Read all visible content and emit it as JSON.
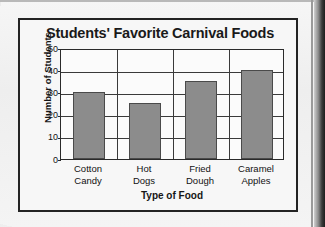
{
  "chart_data": {
    "type": "bar",
    "title": "Students' Favorite Carnival Foods",
    "xlabel": "Type of Food",
    "ylabel": "Number of Students",
    "categories": [
      "Cotton Candy",
      "Hot Dogs",
      "Fried Dough",
      "Caramel Apples"
    ],
    "category_lines": [
      [
        "Cotton",
        "Candy"
      ],
      [
        "Hot",
        "Dogs"
      ],
      [
        "Fried",
        "Dough"
      ],
      [
        "Caramel",
        "Apples"
      ]
    ],
    "values": [
      30,
      25,
      35,
      40
    ],
    "ylim": [
      0,
      50
    ],
    "yticks": [
      0,
      10,
      20,
      30,
      40,
      50
    ],
    "ytick_labels": [
      "0",
      "10",
      "20",
      "30",
      "40",
      "50"
    ],
    "grid": "horizontal-and-category-dividers",
    "legend": "none",
    "bar_color": "#8c8c8c",
    "bar_edge_color": "#4a4a4a",
    "axis_color": "#2a2a2a",
    "plot_background": "#fbfbfb",
    "figure_background": "#f7f7f7",
    "figure_border_color": "#232323"
  },
  "page": {
    "background": "#f2f2f2",
    "edge_band_color": "#1d1d1d"
  }
}
